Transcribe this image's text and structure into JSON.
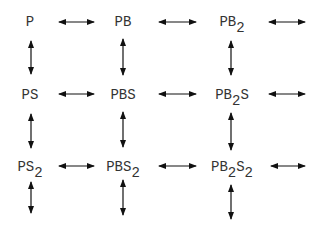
{
  "diagram": {
    "title": "",
    "type": "reaction-lattice",
    "nodes": [
      {
        "id": "P",
        "base": "P",
        "parts": [
          [
            "P",
            ""
          ]
        ],
        "row": 0,
        "col": 0,
        "x": 30,
        "y": 15
      },
      {
        "id": "PB",
        "base": "PB",
        "parts": [
          [
            "PB",
            ""
          ]
        ],
        "row": 0,
        "col": 1,
        "x": 123,
        "y": 15
      },
      {
        "id": "PB2",
        "base": "PB2",
        "parts": [
          [
            "PB",
            "2"
          ]
        ],
        "row": 0,
        "col": 2,
        "x": 232,
        "y": 15
      },
      {
        "id": "PS",
        "base": "PS",
        "parts": [
          [
            "PS",
            ""
          ]
        ],
        "row": 1,
        "col": 0,
        "x": 30,
        "y": 88
      },
      {
        "id": "PBS",
        "base": "PBS",
        "parts": [
          [
            "PBS",
            ""
          ]
        ],
        "row": 1,
        "col": 1,
        "x": 123,
        "y": 88
      },
      {
        "id": "PB2S",
        "base": "PB2S",
        "parts": [
          [
            "PB",
            "2"
          ],
          [
            "S",
            ""
          ]
        ],
        "row": 1,
        "col": 2,
        "x": 232,
        "y": 88
      },
      {
        "id": "PS2",
        "base": "PS2",
        "parts": [
          [
            "PS",
            "2"
          ]
        ],
        "row": 2,
        "col": 0,
        "x": 30,
        "y": 160
      },
      {
        "id": "PBS2",
        "base": "PBS2",
        "parts": [
          [
            "PBS",
            "2"
          ]
        ],
        "row": 2,
        "col": 1,
        "x": 123,
        "y": 160
      },
      {
        "id": "PB2S2",
        "base": "PB2S2",
        "parts": [
          [
            "PB",
            "2"
          ],
          [
            "S",
            "2"
          ]
        ],
        "row": 2,
        "col": 2,
        "x": 232,
        "y": 160
      }
    ],
    "labels": {
      "P": "P",
      "PB": "PB",
      "PB2": "PB₂",
      "PS": "PS",
      "PBS": "PBS",
      "PB2S": "PB₂S",
      "PS2": "PS₂",
      "PBS2": "PBS₂",
      "PB2S2": "PB₂S₂"
    },
    "edges": [
      {
        "from": "P",
        "to": "PB",
        "dir": "horizontal",
        "x1": 59,
        "x2": 94,
        "y": 22
      },
      {
        "from": "PB",
        "to": "PB2",
        "dir": "horizontal",
        "x1": 159,
        "x2": 196,
        "y": 22
      },
      {
        "from": "PB2",
        "to": "next",
        "dir": "horizontal",
        "x1": 269,
        "x2": 305,
        "y": 22
      },
      {
        "from": "PS",
        "to": "PBS",
        "dir": "horizontal",
        "x1": 59,
        "x2": 94,
        "y": 94
      },
      {
        "from": "PBS",
        "to": "PB2S",
        "dir": "horizontal",
        "x1": 159,
        "x2": 196,
        "y": 94
      },
      {
        "from": "PB2S",
        "to": "next",
        "dir": "horizontal",
        "x1": 269,
        "x2": 305,
        "y": 94
      },
      {
        "from": "PS2",
        "to": "PBS2",
        "dir": "horizontal",
        "x1": 59,
        "x2": 94,
        "y": 166
      },
      {
        "from": "PBS2",
        "to": "PB2S2",
        "dir": "horizontal",
        "x1": 159,
        "x2": 196,
        "y": 166
      },
      {
        "from": "PB2S2",
        "to": "next",
        "dir": "horizontal",
        "x1": 271,
        "x2": 305,
        "y": 166
      },
      {
        "from": "P",
        "to": "PS",
        "dir": "vertical",
        "x": 31,
        "y1": 41,
        "y2": 74
      },
      {
        "from": "PB",
        "to": "PBS",
        "dir": "vertical",
        "x": 123,
        "y1": 39,
        "y2": 75
      },
      {
        "from": "PB2",
        "to": "PB2S",
        "dir": "vertical",
        "x": 231,
        "y1": 41,
        "y2": 75
      },
      {
        "from": "PS",
        "to": "PS2",
        "dir": "vertical",
        "x": 31,
        "y1": 114,
        "y2": 148
      },
      {
        "from": "PBS",
        "to": "PBS2",
        "dir": "vertical",
        "x": 123,
        "y1": 112,
        "y2": 147
      },
      {
        "from": "PB2S",
        "to": "PB2S2",
        "dir": "vertical",
        "x": 231,
        "y1": 113,
        "y2": 150
      },
      {
        "from": "PS2",
        "to": "next",
        "dir": "vertical",
        "x": 31,
        "y1": 182,
        "y2": 213
      },
      {
        "from": "PBS2",
        "to": "next",
        "dir": "vertical",
        "x": 123,
        "y1": 180,
        "y2": 215
      },
      {
        "from": "PB2S2",
        "to": "next",
        "dir": "vertical",
        "x": 231,
        "y1": 185,
        "y2": 219
      }
    ],
    "colors": {
      "text": "#333333",
      "arrow": "#111111",
      "background": "#ffffff"
    }
  }
}
